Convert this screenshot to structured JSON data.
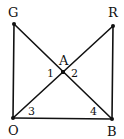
{
  "diagram": {
    "points": {
      "G": {
        "label": "G",
        "x": 14,
        "y": 24
      },
      "R": {
        "label": "R",
        "x": 113,
        "y": 26
      },
      "O": {
        "label": "O",
        "x": 13,
        "y": 118
      },
      "B": {
        "label": "B",
        "x": 112,
        "y": 119
      },
      "A": {
        "label": "A",
        "x": 63,
        "y": 72
      }
    },
    "segments": [
      "GO",
      "RB",
      "OB",
      "GB",
      "OR"
    ],
    "angle_labels": {
      "a1": "1",
      "a2": "2",
      "a3": "3",
      "a4": "4"
    },
    "stroke_color": "#111111"
  }
}
